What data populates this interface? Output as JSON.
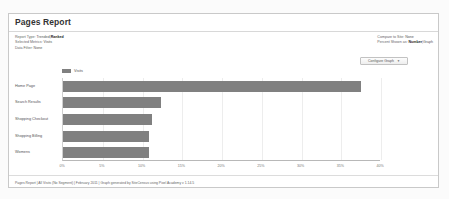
{
  "report": {
    "title": "Pages Report",
    "meta_left": [
      {
        "label": "Report Type:",
        "options": [
          "Trended",
          "Ranked"
        ],
        "selected": "Ranked"
      },
      {
        "label": "Selected Metrics:",
        "value": "Visits"
      },
      {
        "label": "Data Filter:",
        "value": "None"
      }
    ],
    "meta_right": [
      {
        "label": "Compare to Site:",
        "value": "None"
      },
      {
        "label": "Percent Shown as:",
        "options": [
          "Number",
          "Graph"
        ],
        "selected": "Number"
      }
    ],
    "configure_button": {
      "label": "Configure Graph",
      "caret": "chevron-down-icon"
    },
    "footer": "Pages Report | All Visits (No Segment) | February 2011 | Graph generated by SiteCensus using Pixel Academy v 1.14.5"
  },
  "colors": {
    "bar": "#808080",
    "card_border": "#c9c9c9",
    "grid": "#ededed",
    "axis": "#b8b8b8"
  },
  "chart_data": {
    "type": "bar",
    "orientation": "horizontal",
    "title": "",
    "xlabel": "",
    "ylabel": "",
    "xlim": [
      0,
      40
    ],
    "x_tick_labels": [
      "0%",
      "5%",
      "10%",
      "15%",
      "20%",
      "25%",
      "30%",
      "35%",
      "40%"
    ],
    "x_ticks": [
      0,
      5,
      10,
      15,
      20,
      25,
      30,
      35,
      40
    ],
    "grid": true,
    "legend": [
      "Visits"
    ],
    "legend_position": "top-left",
    "categories": [
      "Home Page",
      "Search Results",
      "Shopping Checkout",
      "Shopping Billing",
      "Womens"
    ],
    "series": [
      {
        "name": "Visits",
        "values": [
          37.5,
          12.3,
          11.2,
          10.8,
          10.8
        ]
      }
    ]
  }
}
